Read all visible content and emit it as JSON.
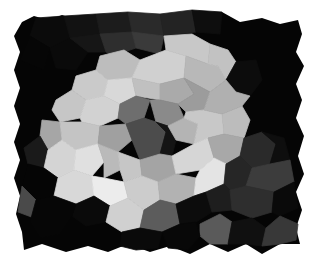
{
  "image": {
    "width": 314,
    "height": 267,
    "background": "#ffffff",
    "description": "Grayscale Voronoi mosaic: a large bright cluster of light-gray cells on a black field with jagged borders",
    "border_polygon": "22,22 34,16 48,20 62,15 78,20 96,14 110,20 128,12 140,20 160,14 176,24 192,10 206,20 222,12 240,22 262,18 280,24 298,20 302,34 296,52 304,66 296,84 302,100 296,118 304,136 298,156 304,174 296,192 302,210 296,228 300,244 280,244 262,254 246,244 228,252 210,244 190,254 170,246 150,252 128,244 108,252 88,246 66,252 42,244 24,250 22,232 16,214 20,196 14,178 20,160 14,142 20,124 14,106 20,88 14,70 20,52 14,36",
    "border_color": "#050505",
    "cells": [
      {
        "points": "36,18 64,16 70,38 50,48 30,36",
        "fill": "#0b0b0b"
      },
      {
        "points": "64,16 96,14 100,34 70,38",
        "fill": "#121212"
      },
      {
        "points": "96,14 128,12 132,32 100,34",
        "fill": "#1c1c1c"
      },
      {
        "points": "128,12 160,14 164,36 132,32",
        "fill": "#2a2a2a"
      },
      {
        "points": "160,14 192,10 196,32 164,36",
        "fill": "#232323"
      },
      {
        "points": "192,10 222,12 220,34 196,32",
        "fill": "#0e0e0e"
      },
      {
        "points": "30,36 50,48 44,70 20,60",
        "fill": "#060606"
      },
      {
        "points": "50,48 70,38 88,52 76,70 56,68",
        "fill": "#0a0a0a"
      },
      {
        "points": "70,38 100,34 106,52 88,52",
        "fill": "#161616"
      },
      {
        "points": "100,34 132,32 136,48 112,56 106,52",
        "fill": "#2e2e2e"
      },
      {
        "points": "132,32 164,36 160,54 136,48",
        "fill": "#3a3a3a"
      },
      {
        "points": "100,56 124,50 140,60 132,78 108,80 96,70",
        "fill": "#bdbdbd"
      },
      {
        "points": "140,60 166,50 186,56 184,78 160,84 132,78",
        "fill": "#d0d0d0"
      },
      {
        "points": "164,36 192,34 210,44 208,64 186,56 166,50",
        "fill": "#c8c8c8"
      },
      {
        "points": "186,56 208,64 218,66 226,80 210,92 184,78",
        "fill": "#b8b8b8"
      },
      {
        "points": "210,44 228,50 236,62 226,80 218,66 208,64",
        "fill": "#c2c2c2"
      },
      {
        "points": "76,76 96,70 108,80 104,96 86,100 72,90",
        "fill": "#cacaca"
      },
      {
        "points": "108,80 132,78 136,96 120,104 104,96",
        "fill": "#d8d8d8"
      },
      {
        "points": "132,78 160,84 160,100 136,96",
        "fill": "#c0c0c0"
      },
      {
        "points": "160,84 184,78 194,94 178,104 160,100",
        "fill": "#aaaaaa"
      },
      {
        "points": "184,78 210,92 204,110 186,112 178,104 194,94",
        "fill": "#9c9c9c"
      },
      {
        "points": "56,100 72,90 86,100 80,118 60,122 52,110",
        "fill": "#c6c6c6"
      },
      {
        "points": "86,100 104,96 120,104 118,118 100,126 82,122 80,118",
        "fill": "#d2d2d2"
      },
      {
        "points": "120,104 136,96 150,100 144,118 126,124 118,118",
        "fill": "#6e6e6e"
      },
      {
        "points": "150,100 160,100 178,104 184,118 168,126 156,122",
        "fill": "#8a8a8a"
      },
      {
        "points": "42,120 60,122 62,140 48,150 40,136",
        "fill": "#a6a6a6"
      },
      {
        "points": "60,122 82,122 100,126 98,144 76,150 62,140",
        "fill": "#c4c4c4"
      },
      {
        "points": "100,126 126,124 132,140 118,152 98,144",
        "fill": "#a0a0a0"
      },
      {
        "points": "126,124 144,118 156,122 166,132 160,154 140,160 132,140",
        "fill": "#4c4c4c"
      },
      {
        "points": "156,122 168,126 176,140 172,156 160,154 166,132",
        "fill": "#141414"
      },
      {
        "points": "168,126 184,118 198,124 194,144 176,140",
        "fill": "#b4b4b4"
      },
      {
        "points": "186,112 204,110 222,114 224,134 208,138 194,144 198,124 184,118",
        "fill": "#c8c8c8"
      },
      {
        "points": "222,114 242,106 250,120 244,138 224,134",
        "fill": "#bcbcbc"
      },
      {
        "points": "226,80 236,62 256,60 262,80 250,96 236,92",
        "fill": "#0c0c0c"
      },
      {
        "points": "210,92 226,80 236,92 250,96 242,106 222,114 204,110",
        "fill": "#b0b0b0"
      },
      {
        "points": "40,136 48,150 44,168 28,164 24,148",
        "fill": "#1a1a1a"
      },
      {
        "points": "48,150 62,140 76,150 74,170 58,178 44,168",
        "fill": "#d4d4d4"
      },
      {
        "points": "76,150 98,144 104,162 92,176 74,170",
        "fill": "#e0e0e0"
      },
      {
        "points": "98,144 118,152 120,170 104,178 104,162",
        "fill": "#bababa"
      },
      {
        "points": "118,152 140,160 142,176 124,182 120,170",
        "fill": "#c6c6c6"
      },
      {
        "points": "140,160 160,154 172,156 176,174 158,182 142,176",
        "fill": "#a4a4a4"
      },
      {
        "points": "172,156 194,144 208,138 214,158 200,170 176,174",
        "fill": "#d6d6d6"
      },
      {
        "points": "208,138 224,134 244,138 240,156 226,164 214,158",
        "fill": "#a8a8a8"
      },
      {
        "points": "244,138 262,132 276,144 270,164 252,168 240,156",
        "fill": "#2a2a2a"
      },
      {
        "points": "262,132 284,138 290,160 276,164 270,164 276,144",
        "fill": "#0e0e0e"
      },
      {
        "points": "28,164 44,168 58,178 54,196 36,200 22,186",
        "fill": "#050505"
      },
      {
        "points": "22,186 36,200 34,218 18,212",
        "fill": "#4a4a4a"
      },
      {
        "points": "58,178 74,170 92,176 94,196 76,204 54,196",
        "fill": "#d8d8d8"
      },
      {
        "points": "92,176 104,178 124,182 128,198 110,206 94,196",
        "fill": "#ececec"
      },
      {
        "points": "124,182 142,176 158,182 160,200 144,210 128,198",
        "fill": "#cccccc"
      },
      {
        "points": "158,182 176,174 196,178 194,196 176,204 160,200",
        "fill": "#b2b2b2"
      },
      {
        "points": "196,178 200,170 214,158 226,164 224,184 206,192 194,196",
        "fill": "#e4e4e4"
      },
      {
        "points": "226,164 240,156 252,168 246,186 230,190 224,184",
        "fill": "#262626"
      },
      {
        "points": "252,168 270,164 290,160 294,182 274,192 246,186",
        "fill": "#3c3c3c"
      },
      {
        "points": "76,204 94,196 110,206 106,222 86,226 72,216",
        "fill": "#0a0a0a"
      },
      {
        "points": "110,206 128,198 144,210 140,228 122,232 106,222",
        "fill": "#d0d0d0"
      },
      {
        "points": "144,210 160,200 176,204 180,224 162,232 140,228",
        "fill": "#5c5c5c"
      },
      {
        "points": "176,204 194,196 206,192 212,212 196,222 180,224",
        "fill": "#0c0c0c"
      },
      {
        "points": "206,192 224,184 230,190 232,210 212,212",
        "fill": "#1e1e1e"
      },
      {
        "points": "230,190 246,186 274,192 272,212 252,218 232,210",
        "fill": "#2e2e2e"
      },
      {
        "points": "274,192 294,182 298,208 280,216 272,212",
        "fill": "#0a0a0a"
      },
      {
        "points": "200,224 220,214 232,222 228,244 210,244 200,236",
        "fill": "#5a5a5a"
      },
      {
        "points": "232,222 252,218 266,228 262,246 246,244 228,244",
        "fill": "#101010"
      },
      {
        "points": "266,228 280,216 298,224 296,240 280,244 262,246",
        "fill": "#383838"
      },
      {
        "points": "36,200 54,196 76,204 72,216 60,234 40,238 30,222",
        "fill": "#060606"
      },
      {
        "points": "122,232 140,228 162,232 158,248 136,250 120,246",
        "fill": "#0a0a0a"
      },
      {
        "points": "162,232 180,224 196,222 200,236 188,250 168,248",
        "fill": "#080808"
      }
    ]
  }
}
